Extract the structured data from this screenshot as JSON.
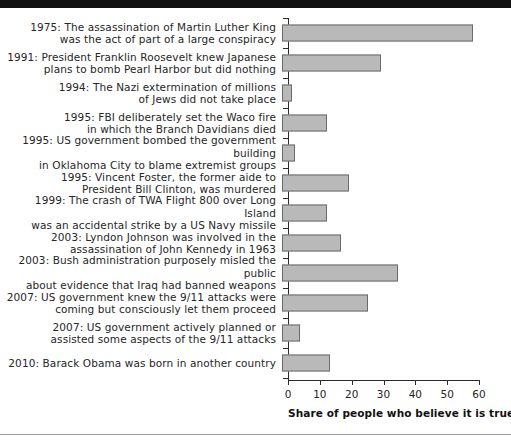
{
  "chart_data": {
    "type": "bar",
    "orientation": "horizontal",
    "title": "",
    "xlabel": "Share of people who believe it is true (%)",
    "ylabel": "",
    "xlim": [
      0,
      60
    ],
    "xticks": [
      0,
      10,
      20,
      30,
      40,
      50,
      60
    ],
    "xtick_labels": [
      "0",
      "10",
      "20",
      "30",
      "40",
      "50",
      "60"
    ],
    "grid": false,
    "legend": null,
    "bar_color": "#b9b9b9",
    "bar_edge_color": "#6b6b6b",
    "axis_color": "#2b2b2b",
    "text_color": "#262626",
    "categories": [
      "1975: The assassination of Martin Luther King\nwas the act of part of a large conspiracy",
      "1991: President Franklin Roosevelt knew Japanese\nplans to bomb Pearl Harbor but did nothing",
      "1994: The Nazi extermination of millions\nof Jews did not take place",
      "1995: FBI deliberately set the Waco fire\nin which the Branch Davidians died",
      "1995: US government bombed the government building\nin Oklahoma City to blame extremist groups",
      "1995: Vincent Foster, the former aide to\nPresident Bill Clinton, was murdered",
      "1999: The crash of TWA Flight 800 over Long Island\nwas an accidental strike by a US Navy missile",
      "2003: Lyndon Johnson was involved in the\nassassination of John Kennedy in 1963",
      "2003: Bush administration purposely misled the public\nabout evidence that Iraq had banned weapons",
      "2007: US government knew the 9/11 attacks were\ncoming but consciously let them proceed",
      "2007: US government actively planned or\nassisted some aspects of the 9/11 attacks",
      "2010: Barack Obama was born in another country"
    ],
    "values": [
      60,
      31,
      3,
      14,
      4,
      21,
      14,
      18.5,
      36.5,
      27,
      5.5,
      15
    ]
  }
}
